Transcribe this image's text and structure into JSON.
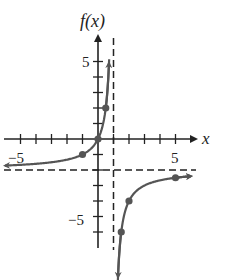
{
  "chart_data": {
    "type": "line",
    "title": "",
    "function": "f(x) = 2x / (1 - x)",
    "xlabel": "x",
    "ylabel": "f(x)",
    "xlim": [
      -6,
      6
    ],
    "ylim": [
      -7,
      7
    ],
    "x_tick_labels": [
      "-5",
      "5"
    ],
    "y_tick_labels": [
      "5",
      "-5"
    ],
    "x_ticks": [
      -5,
      -4,
      -3,
      -2,
      -1,
      1,
      2,
      3,
      4,
      5
    ],
    "y_ticks": [
      -6,
      -5,
      -4,
      -3,
      -2,
      -1,
      1,
      2,
      3,
      4,
      5
    ],
    "grid": false,
    "asymptotes": {
      "vertical": [
        1
      ],
      "horizontal": [
        -2
      ]
    },
    "series": [
      {
        "name": "left branch",
        "domain": [
          -6,
          0.72
        ],
        "points": [
          {
            "x": -1,
            "y": -1
          },
          {
            "x": 0,
            "y": 0
          },
          {
            "x": 0.5,
            "y": 2
          }
        ]
      },
      {
        "name": "right branch",
        "domain": [
          1.28,
          6
        ],
        "points": [
          {
            "x": 1.5,
            "y": -6
          },
          {
            "x": 2,
            "y": -4
          },
          {
            "x": 5,
            "y": -2.5
          }
        ]
      }
    ],
    "colors": {
      "axes": "#222222",
      "curve": "#555555",
      "asymptote": "#222222"
    }
  },
  "labels": {
    "y_axis": "f(x)",
    "x_axis": "x",
    "x_neg5": "−5",
    "x_pos5": "5",
    "y_pos5": "5",
    "y_neg5": "−5"
  }
}
